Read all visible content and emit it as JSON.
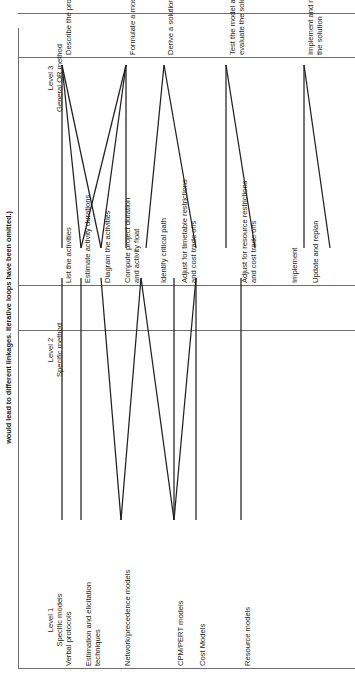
{
  "caption": "would lead to different linkages. Iterative loops have been omitted.)",
  "columns": {
    "level1": {
      "line1": "Level 1",
      "line2": "Specific models"
    },
    "level2": {
      "line1": "Level 2",
      "line2": "Specific method"
    },
    "level3": {
      "line1": "Level 3",
      "line2": "General OR method"
    }
  },
  "level1_items": [
    {
      "id": "verbal-protocols",
      "label": "Verbal protocols"
    },
    {
      "id": "estimation-elicitation",
      "label": "Estimation and elicitation techniques"
    },
    {
      "id": "network-precedence-models",
      "label": "Network/precedence models"
    },
    {
      "id": "cpm-pert-models",
      "label": "CPM/PERT models"
    },
    {
      "id": "cost-models",
      "label": "Cost Models"
    },
    {
      "id": "resource-models",
      "label": "Resource models"
    }
  ],
  "level2_items": [
    {
      "id": "list-the-activities",
      "label": "List the activities"
    },
    {
      "id": "estimate-activity-durations",
      "label": "Estimate activity durations"
    },
    {
      "id": "diagram-the-activities",
      "label": "Diagram the activities"
    },
    {
      "id": "compute-project-duration",
      "label": "Compute project duration and activity float"
    },
    {
      "id": "identify-critical-path",
      "label": "Identify critical path"
    },
    {
      "id": "adjust-timetable",
      "label": "Adjust for timetable restrictions and cost trade offs"
    },
    {
      "id": "adjust-resource",
      "label": "Adjust for resource restrictions and cost trade offs"
    },
    {
      "id": "implement",
      "label": "Implement"
    },
    {
      "id": "update-and-replan",
      "label": "Update and replan"
    }
  ],
  "level3_items": [
    {
      "id": "describe-the-problem",
      "label": "Describe the problem"
    },
    {
      "id": "formulate-a-model",
      "label": "Formulate a model"
    },
    {
      "id": "derive-a-solution",
      "label": "Derive a solution"
    },
    {
      "id": "test-and-evaluate",
      "label": "Test the model and evaluate the solution"
    },
    {
      "id": "implement-and-maintain",
      "label": "Implement and maintain the solution"
    }
  ],
  "colors": {
    "line": "#231f20",
    "rule": "#6d6e71",
    "background": "#ffffff"
  }
}
